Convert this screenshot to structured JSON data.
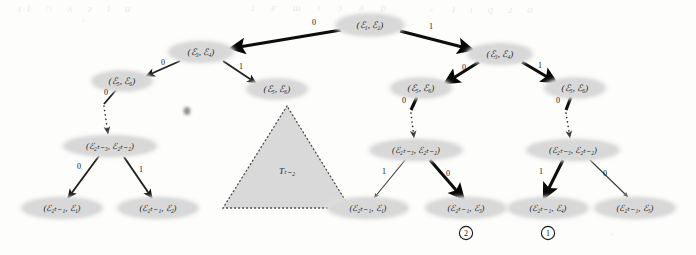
{
  "figure": {
    "type": "binary-decision-tree-diagram",
    "caption": "",
    "background_color": "#fdfdfc",
    "node_fill": "#d8d8d8",
    "edge_color": "#1a1a1a"
  },
  "nodes": {
    "root": {
      "label": "(ℰ₁, ℰ₂)",
      "x": 370,
      "y": 25
    },
    "left_l1": {
      "label": "(ℰ₃, ℰ₄)",
      "x": 201,
      "y": 52
    },
    "left_l2a": {
      "label": "(ℰ₅, ℰ₆)",
      "x": 122,
      "y": 81
    },
    "left_l2b": {
      "label": "(ℰ₅, ℰ₆)",
      "x": 277,
      "y": 89
    },
    "left_mid": {
      "label": "(ℰ₂ₜ₋₃, ℰ₂ₜ₋₂)",
      "x": 110,
      "y": 146
    },
    "left_leaf1": {
      "label": "(ℰ₂ₜ₋₁, ℰ₁)",
      "x": 62,
      "y": 208
    },
    "left_leaf2": {
      "label": "(ℰ₂ₜ₋₁, ℰ₂)",
      "x": 158,
      "y": 208
    },
    "right_l1": {
      "label": "(ℰ₃, ℰ₄)",
      "x": 500,
      "y": 54
    },
    "right_l2a": {
      "label": "(ℰ₅, ℰ₆)",
      "x": 421,
      "y": 88
    },
    "right_l2b": {
      "label": "(ℰ₅, ℰ₆)",
      "x": 575,
      "y": 88
    },
    "right_mida": {
      "label": "(ℰ₂ₜ₋₃, ℰ₂ₜ₋₂)",
      "x": 416,
      "y": 150
    },
    "right_midb": {
      "label": "(ℰ₂ₜ₋₃, ℰ₂ₜ₋₂)",
      "x": 573,
      "y": 150
    },
    "right_leaf1": {
      "label": "(ℰ₂ₜ₋₁, ℰ₁)",
      "x": 368,
      "y": 208
    },
    "right_leaf2": {
      "label": "(ℰ₂ₜ₋₁, ℰ₃)",
      "x": 466,
      "y": 208
    },
    "right_leaf3": {
      "label": "(ℰ₂ₜ₋₁, ℰ₄)",
      "x": 548,
      "y": 208
    },
    "right_leaf4": {
      "label": "(ℰ₂ₜ₋₁, ℰ₅)",
      "x": 635,
      "y": 208
    }
  },
  "edge_labels": {
    "root_left": "0",
    "root_right": "1",
    "left_l1_left": "0",
    "left_l1_right": "1",
    "left_l2a_down": "0",
    "left_mid_left": "0",
    "left_mid_right": "1",
    "right_l1_left": "0",
    "right_l1_right": "1",
    "right_l2a_down": "0",
    "right_l2b_down": "0",
    "right_mida_left": "1",
    "right_mida_right": "0",
    "right_midb_left": "1",
    "right_midb_right": "0"
  },
  "triangle": {
    "label": "Tₜ₋₂",
    "apex_x": 287,
    "apex_y": 106,
    "left_x": 223,
    "left_y": 208,
    "right_x": 350,
    "right_y": 208
  },
  "markers": [
    {
      "name": "circled-two",
      "text": "2",
      "x": 466,
      "y": 233
    },
    {
      "name": "circled-one",
      "text": "1",
      "x": 548,
      "y": 233
    }
  ],
  "scan_artifacts": {
    "smudge_present": true,
    "bleed_through_top": "bleed-through text from reverse page"
  }
}
